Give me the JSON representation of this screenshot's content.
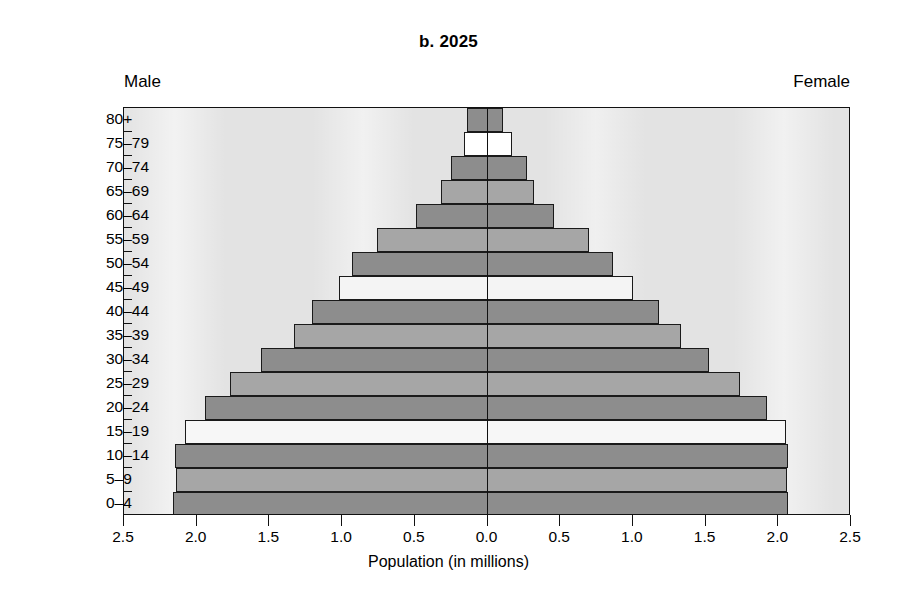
{
  "chart_data": {
    "type": "bar",
    "subtype": "population-pyramid",
    "title": "b. 2025",
    "xlabel": "Population (in millions)",
    "ylabel": "",
    "left_group_label": "Male",
    "right_group_label": "Female",
    "categories": [
      "80+",
      "75–79",
      "70–74",
      "65–69",
      "60–64",
      "55–59",
      "50–54",
      "45–49",
      "40–44",
      "35–39",
      "30–34",
      "25–29",
      "20–24",
      "15–19",
      "10–14",
      "5–9",
      "0–4"
    ],
    "xlim": [
      -2.5,
      2.5
    ],
    "xticks": [
      -2.5,
      -2.0,
      -1.5,
      -1.0,
      -0.5,
      0.0,
      0.5,
      1.0,
      1.5,
      2.0,
      2.5
    ],
    "xticklabels": [
      "2.5",
      "2.0",
      "1.5",
      "1.0",
      "0.5",
      "0.0",
      "0.5",
      "1.0",
      "1.5",
      "2.0",
      "2.5"
    ],
    "grid": false,
    "legend": false,
    "series": [
      {
        "name": "Male",
        "side": "left",
        "values": [
          0.14,
          0.16,
          0.25,
          0.32,
          0.49,
          0.76,
          0.93,
          1.02,
          1.21,
          1.33,
          1.56,
          1.77,
          1.94,
          2.08,
          2.15,
          2.14,
          2.16
        ]
      },
      {
        "name": "Female",
        "side": "right",
        "values": [
          0.11,
          0.17,
          0.27,
          0.32,
          0.46,
          0.7,
          0.86,
          1.0,
          1.18,
          1.33,
          1.52,
          1.74,
          1.92,
          2.05,
          2.07,
          2.06,
          2.07
        ]
      }
    ],
    "bar_fill_cycle": [
      "#8d8d8d",
      "#ffffff",
      "#a6a6a6"
    ],
    "bar_fills_by_category": [
      "#8d8d8d",
      "#ffffff",
      "#8d8d8d",
      "#a6a6a6",
      "#8d8d8d",
      "#a6a6a6",
      "#8d8d8d",
      "#f4f4f4",
      "#8d8d8d",
      "#a6a6a6",
      "#8d8d8d",
      "#a6a6a6",
      "#8d8d8d",
      "#f7f7f7",
      "#8d8d8d",
      "#a6a6a6",
      "#8d8d8d"
    ]
  },
  "colors": {
    "plot_background": "#e3e3e3",
    "axis": "#111111",
    "bar_dark": "#8d8d8d",
    "bar_light": "#a6a6a6",
    "bar_white": "#ffffff",
    "page_background": "#ffffff"
  }
}
